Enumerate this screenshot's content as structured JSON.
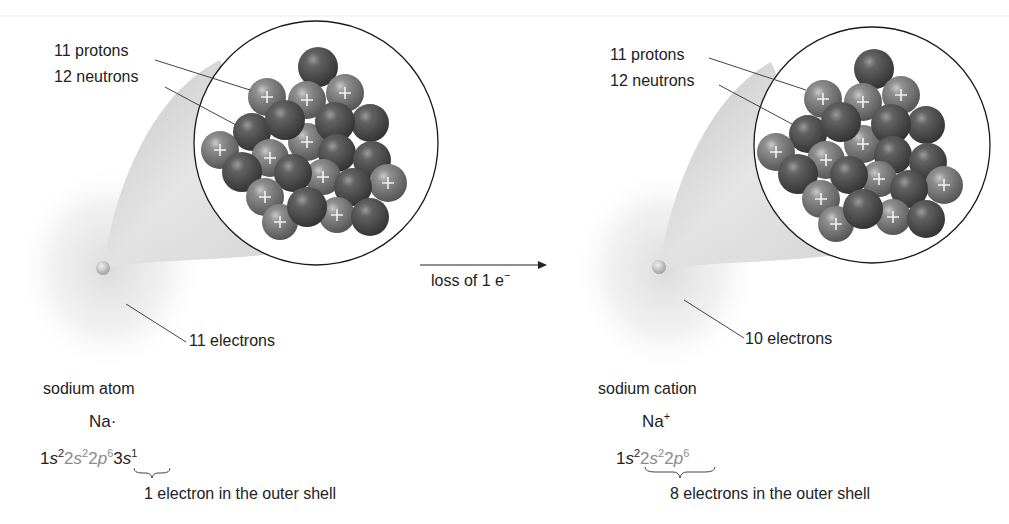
{
  "diagram": {
    "colors": {
      "proton": "#7a7a7a",
      "neutron": "#555555",
      "circle_outline": "#1a1a1a",
      "text": "#222222",
      "grey_text": "#8a8a8a"
    },
    "arrow": {
      "label": "loss of 1 e",
      "superscript": "−"
    },
    "left": {
      "protons_label": "11 protons",
      "neutrons_label": "12 neutrons",
      "electrons_label": "11 electrons",
      "name": "sodium atom",
      "symbol": "Na·",
      "config": {
        "part1_num": "1",
        "part1_orb": "s",
        "part1_sup": "2",
        "part2_num": "2",
        "part2_orb": "s",
        "part2_sup": "2",
        "part3_num": "2",
        "part3_orb": "p",
        "part3_sup": "6",
        "part4_num": "3",
        "part4_orb": "s",
        "part4_sup": "1"
      },
      "brace_note": "1 electron in the outer shell"
    },
    "right": {
      "protons_label": "11 protons",
      "neutrons_label": "12 neutrons",
      "electrons_label": "10 electrons",
      "name": "sodium cation",
      "symbol": "Na",
      "symbol_sup": "+",
      "config": {
        "part1_num": "1",
        "part1_orb": "s",
        "part1_sup": "2",
        "part2_num": "2",
        "part2_orb": "s",
        "part2_sup": "2",
        "part3_num": "2",
        "part3_orb": "p",
        "part3_sup": "6"
      },
      "brace_note": "8 electrons in the outer shell"
    }
  }
}
